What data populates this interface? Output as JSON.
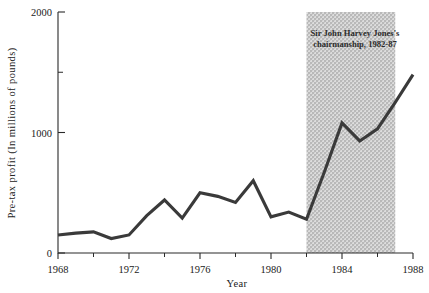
{
  "chart_data": {
    "type": "line",
    "title": "",
    "xlabel": "Year",
    "ylabel": "Pre-tax profit (In millions of pounds)",
    "xlim": [
      1968,
      1988
    ],
    "ylim": [
      0,
      2000
    ],
    "grid": false,
    "legend_position": "none",
    "x_ticks": [
      "1968",
      "1972",
      "1976",
      "1980",
      "1984",
      "1988"
    ],
    "x_tick_values": [
      1968,
      1972,
      1976,
      1980,
      1984,
      1988
    ],
    "x_minor_tick_values": [
      1970,
      1974,
      1978,
      1982,
      1986
    ],
    "y_ticks": [
      "0",
      "1000",
      "2000"
    ],
    "y_tick_values": [
      0,
      1000,
      2000
    ],
    "y_minor_tick_values": [
      1500
    ],
    "x": [
      1968,
      1969,
      1970,
      1971,
      1972,
      1973,
      1974,
      1975,
      1976,
      1977,
      1978,
      1979,
      1980,
      1981,
      1982,
      1983,
      1984,
      1985,
      1986,
      1987,
      1988
    ],
    "values": [
      150,
      165,
      175,
      120,
      150,
      310,
      440,
      290,
      500,
      470,
      420,
      600,
      300,
      340,
      280,
      670,
      1080,
      930,
      1030,
      1250,
      1480
    ],
    "series": [
      {
        "name": "Pre-tax profit",
        "color": "#3a3a3a",
        "values": [
          150,
          165,
          175,
          120,
          150,
          310,
          440,
          290,
          500,
          470,
          420,
          600,
          300,
          340,
          280,
          670,
          1080,
          930,
          1030,
          1250,
          1480
        ]
      }
    ],
    "annotations": [
      {
        "name": "chairmanship-band",
        "type": "vspan",
        "x_start": 1982,
        "x_end": 1987,
        "color": "#c9c9c9",
        "label_line1": "Sir John Harvey Jones's",
        "label_line2": "chairmanship, 1982-87"
      }
    ]
  },
  "axes": {
    "x_title": "Year",
    "y_title": "Pre-tax profit (In millions of pounds)"
  },
  "annotation": {
    "line1": "Sir John Harvey Jones's",
    "line2": "chairmanship, 1982-87"
  },
  "colors": {
    "line": "#3a3a3a",
    "band": "#c9c9c9",
    "axis": "#2a2a2a",
    "text": "#222222",
    "background": "#ffffff"
  }
}
